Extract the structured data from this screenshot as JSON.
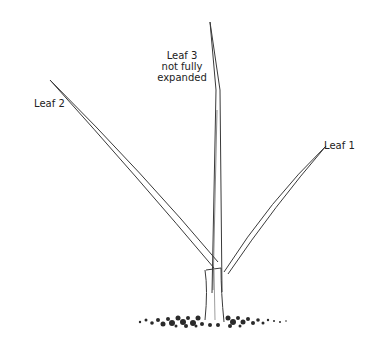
{
  "figure": {
    "labels": {
      "leaf1": "Leaf 1",
      "leaf2": "Leaf 2",
      "leaf3_line1": "Leaf 3",
      "leaf3_line2": "not fully",
      "leaf3_line3": "expanded"
    },
    "colors": {
      "ink": "#3a3a3a",
      "background": "#ffffff"
    }
  }
}
